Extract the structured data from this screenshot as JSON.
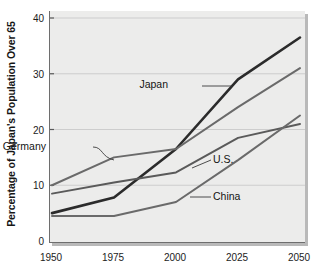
{
  "chart_data": {
    "type": "line",
    "title": "",
    "xlabel": "",
    "ylabel": "Percentage of Japan's Population Over 65",
    "x": [
      1950,
      1975,
      2000,
      2025,
      2050
    ],
    "xticklabels": [
      "1950",
      "1975",
      "2000",
      "2025",
      "2050"
    ],
    "yticklabels": [
      "0",
      "10",
      "20",
      "30",
      "40"
    ],
    "yticks": [
      0,
      10,
      20,
      30,
      40
    ],
    "xlim": [
      1950,
      2050
    ],
    "ylim": [
      0,
      40
    ],
    "grid": "horizontal",
    "legend": "inline-labels",
    "series": [
      {
        "name": "Japan",
        "label": "Japan",
        "color": "#2b2b2b",
        "width": 2.6,
        "values": [
          5.0,
          7.8,
          16.5,
          29.0,
          36.5
        ]
      },
      {
        "name": "Germany",
        "label": "Germany",
        "color": "#6a6a6a",
        "width": 2.0,
        "values": [
          10.0,
          15.0,
          16.5,
          24.0,
          31.0
        ]
      },
      {
        "name": "U.S.",
        "label": "U.S.",
        "color": "#5a5a5a",
        "width": 2.0,
        "values": [
          8.5,
          10.5,
          12.3,
          18.5,
          21.0
        ]
      },
      {
        "name": "China",
        "label": "China",
        "color": "#6a6a6a",
        "width": 2.0,
        "values": [
          4.5,
          4.5,
          7.0,
          14.5,
          22.5
        ]
      }
    ],
    "annotations": [
      {
        "name": "japan-label",
        "text": "Japan",
        "x": 168,
        "y": 88
      },
      {
        "name": "germany-label",
        "text": "Germany",
        "x": 46,
        "y": 150
      },
      {
        "name": "us-label",
        "text": "U.S.",
        "x": 213,
        "y": 163
      },
      {
        "name": "china-label",
        "text": "China",
        "x": 213,
        "y": 200
      }
    ]
  },
  "axes": {
    "y_title": "Percentage of Japan's Population Over 65"
  }
}
